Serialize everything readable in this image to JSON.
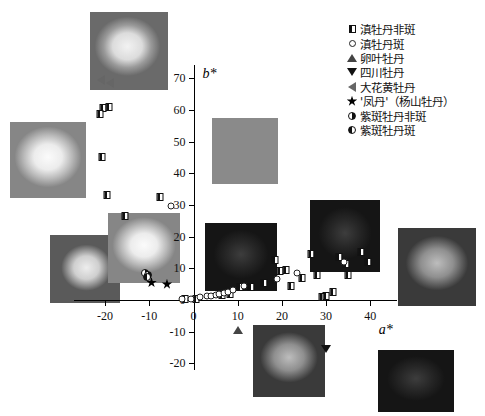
{
  "chart_data": {
    "type": "scatter",
    "title": "",
    "xlabel": "a*",
    "ylabel": "b*",
    "xlim": [
      -27,
      46
    ],
    "ylim": [
      -22,
      74
    ],
    "xticks": [
      -20,
      -10,
      0,
      10,
      20,
      30,
      40
    ],
    "yticks": [
      -20,
      -10,
      0,
      10,
      20,
      30,
      40,
      50,
      60,
      70
    ],
    "xtick_labels": [
      "-20",
      "-10",
      "0",
      "10",
      "20",
      "30",
      "40"
    ],
    "ytick_labels": [
      "-20",
      "-10",
      "0",
      "10",
      "20",
      "30",
      "40",
      "50",
      "60",
      "70"
    ],
    "grid": false,
    "legend_position": "top-right",
    "series": [
      {
        "name": "滇牡丹非斑",
        "marker": "half-square",
        "points": [
          [
            -20.5,
            60.5
          ],
          [
            -19.2,
            60.8
          ],
          [
            -21.2,
            58.6
          ],
          [
            -20.8,
            45.0
          ],
          [
            -19.5,
            33.0
          ],
          [
            -15.5,
            26.5
          ],
          [
            -7.5,
            32.5
          ],
          [
            -2.0,
            0.2
          ],
          [
            0.5,
            0.4
          ],
          [
            6.5,
            1.5
          ],
          [
            8.2,
            1.8
          ],
          [
            10.5,
            4.2
          ],
          [
            13.0,
            4.0
          ],
          [
            16.0,
            5.5
          ],
          [
            18.5,
            12.5
          ],
          [
            19.5,
            9.0
          ],
          [
            21.0,
            9.5
          ],
          [
            22.0,
            4.5
          ],
          [
            24.5,
            7.0
          ],
          [
            26.5,
            14.5
          ],
          [
            28.0,
            8.0
          ],
          [
            29.0,
            1.0
          ],
          [
            30.0,
            1.2
          ],
          [
            31.5,
            2.5
          ],
          [
            33.0,
            13.5
          ],
          [
            34.5,
            11.5
          ],
          [
            35.0,
            8.0
          ],
          [
            38.0,
            15.0
          ],
          [
            39.5,
            12.0
          ]
        ]
      },
      {
        "name": "滇牡丹斑",
        "marker": "circle",
        "points": [
          [
            -5.0,
            29.5
          ],
          [
            -2.5,
            0.3
          ],
          [
            -0.5,
            0.3
          ],
          [
            1.5,
            1.0
          ],
          [
            3.0,
            1.2
          ],
          [
            4.0,
            1.4
          ],
          [
            5.0,
            1.6
          ],
          [
            5.8,
            1.8
          ],
          [
            6.8,
            2.2
          ],
          [
            7.8,
            2.6
          ],
          [
            9.0,
            3.0
          ],
          [
            11.5,
            4.5
          ],
          [
            19.0,
            6.5
          ],
          [
            23.5,
            8.5
          ],
          [
            34.0,
            12.0
          ]
        ]
      },
      {
        "name": "卵叶牡丹",
        "marker": "triangle-up",
        "points": [
          [
            10.0,
            -9.5
          ]
        ]
      },
      {
        "name": "四川牡丹",
        "marker": "triangle-down",
        "points": [
          [
            30.0,
            -15.5
          ]
        ]
      },
      {
        "name": "大花黄牡丹",
        "marker": "triangle-left",
        "points": [
          [
            -21.0,
            69.5
          ],
          [
            -19.0,
            68.5
          ]
        ]
      },
      {
        "name": "'凤丹'（杨山牡丹）",
        "marker": "star",
        "points": [
          [
            -9.5,
            5.5
          ],
          [
            -6.0,
            5.0
          ]
        ]
      },
      {
        "name": "紫斑牡丹非斑",
        "marker": "half-circle-right",
        "points": [
          [
            -11.0,
            8.5
          ],
          [
            -10.3,
            8.0
          ]
        ]
      },
      {
        "name": "紫斑牡丹斑",
        "marker": "half-circle-left",
        "points": [
          [
            -10.6,
            7.2
          ]
        ]
      }
    ]
  },
  "axes": {
    "x_title": "a*",
    "y_title": "b*"
  },
  "legend": {
    "items": [
      {
        "label": "滇牡丹非斑",
        "marker": "half-square"
      },
      {
        "label": "滇牡丹斑",
        "marker": "circle"
      },
      {
        "label": "卵叶牡丹",
        "marker": "triangle-up"
      },
      {
        "label": "四川牡丹",
        "marker": "triangle-down"
      },
      {
        "label": "大花黄牡丹",
        "marker": "triangle-left"
      },
      {
        "label": "'凤丹'（杨山牡丹）",
        "marker": "star"
      },
      {
        "label": "紫斑牡丹非斑",
        "marker": "half-circle-right"
      },
      {
        "label": "紫斑牡丹斑",
        "marker": "half-circle-left"
      }
    ]
  },
  "photos": [
    {
      "name": "peony-photo-top-center",
      "x": 90,
      "y": 12,
      "w": 78,
      "h": 78,
      "tone": "ph-a"
    },
    {
      "name": "peony-photo-left-upper",
      "x": 10,
      "y": 122,
      "w": 76,
      "h": 76,
      "tone": "ph-light"
    },
    {
      "name": "peony-photo-left-lower",
      "x": 50,
      "y": 235,
      "w": 70,
      "h": 68,
      "tone": "ph-c"
    },
    {
      "name": "peony-photo-mid-left",
      "x": 108,
      "y": 213,
      "w": 72,
      "h": 70,
      "tone": "ph-light"
    },
    {
      "name": "peony-photo-center-upper",
      "x": 212,
      "y": 118,
      "w": 66,
      "h": 66,
      "tone": "ph-b"
    },
    {
      "name": "peony-photo-center",
      "x": 205,
      "y": 223,
      "w": 72,
      "h": 68,
      "tone": "ph-dark"
    },
    {
      "name": "peony-photo-bottom-center",
      "x": 253,
      "y": 325,
      "w": 72,
      "h": 72,
      "tone": "ph-mid"
    },
    {
      "name": "peony-photo-upper-right",
      "x": 310,
      "y": 200,
      "w": 70,
      "h": 72,
      "tone": "ph-dark"
    },
    {
      "name": "peony-photo-right",
      "x": 398,
      "y": 228,
      "w": 78,
      "h": 78,
      "tone": "ph-mid"
    },
    {
      "name": "peony-photo-bottom-right",
      "x": 378,
      "y": 350,
      "w": 76,
      "h": 62,
      "tone": "ph-dark"
    }
  ],
  "colors": {
    "axis": "#000000",
    "marker_fill": "#111111",
    "background": "#ffffff"
  }
}
